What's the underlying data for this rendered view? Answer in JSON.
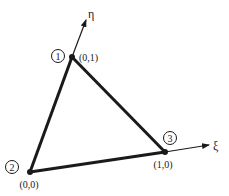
{
  "diagram": {
    "type": "reference triangle element",
    "axes": {
      "eta": {
        "label": "η"
      },
      "xi": {
        "label": "ξ"
      }
    },
    "nodes": [
      {
        "id": "1",
        "number_label": "1",
        "coord_label": "(0,1)"
      },
      {
        "id": "2",
        "number_label": "2",
        "coord_label": "(0,0)"
      },
      {
        "id": "3",
        "number_label": "3",
        "coord_label": "(1,0)"
      }
    ],
    "colors": {
      "line": "#1a1a1a",
      "background": "#ffffff"
    }
  }
}
